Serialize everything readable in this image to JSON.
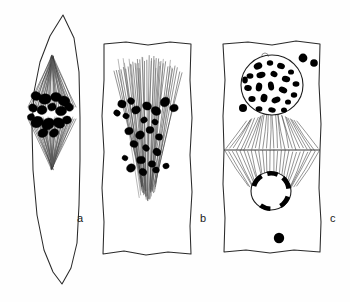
{
  "figure": {
    "caption_visible": false,
    "background_color": "#fefefe",
    "ink_color": "#1a1a1a",
    "chromatin_color": "#000000",
    "panel_count": 3
  },
  "panels": [
    {
      "id": "a",
      "label": "a",
      "label_x": 77,
      "label_y": 222,
      "stage_name": "metaphase",
      "cell_outline": "M 63 15 L 74 38 L 79 72 L 80 118 L 80 160 L 79 205 L 77 243 L 71 268 L 62 284 L 53 272 L 44 250 L 37 215 L 33 170 L 32 128 L 34 92 L 40 62 L 50 36 Z",
      "spindle": {
        "type": "fusiform",
        "pole_top": [
          52,
          57
        ],
        "pole_bottom": [
          52,
          168
        ],
        "equator_y": 113,
        "half_width": 25,
        "fiber_count": 26
      },
      "chromosomes": [
        {
          "cx": 36,
          "cy": 96,
          "rx": 5.0,
          "ry": 4.4
        },
        {
          "cx": 45,
          "cy": 99,
          "rx": 6.2,
          "ry": 5.2
        },
        {
          "cx": 56,
          "cy": 97,
          "rx": 5.4,
          "ry": 4.6
        },
        {
          "cx": 64,
          "cy": 101,
          "rx": 6.0,
          "ry": 5.0
        },
        {
          "cx": 33,
          "cy": 108,
          "rx": 4.4,
          "ry": 4.0
        },
        {
          "cx": 42,
          "cy": 110,
          "rx": 5.0,
          "ry": 4.4
        },
        {
          "cx": 52,
          "cy": 107,
          "rx": 4.2,
          "ry": 3.8
        },
        {
          "cx": 61,
          "cy": 111,
          "rx": 5.6,
          "ry": 4.8
        },
        {
          "cx": 69,
          "cy": 107,
          "rx": 4.6,
          "ry": 4.0
        },
        {
          "cx": 37,
          "cy": 122,
          "rx": 6.4,
          "ry": 5.4
        },
        {
          "cx": 48,
          "cy": 124,
          "rx": 6.6,
          "ry": 5.6
        },
        {
          "cx": 59,
          "cy": 123,
          "rx": 6.0,
          "ry": 5.0
        },
        {
          "cx": 67,
          "cy": 120,
          "rx": 4.4,
          "ry": 4.0
        },
        {
          "cx": 43,
          "cy": 133,
          "rx": 5.2,
          "ry": 4.2
        },
        {
          "cx": 54,
          "cy": 133,
          "rx": 4.8,
          "ry": 4.0
        },
        {
          "cx": 31,
          "cy": 117,
          "rx": 3.6,
          "ry": 3.2
        }
      ]
    },
    {
      "id": "b",
      "label": "b",
      "label_x": 200,
      "label_y": 222,
      "stage_name": "anaphase",
      "cell_outline": "M 104 44 L 126 42 L 148 45 L 170 42 L 191 44 L 190 80 L 192 118 L 190 155 L 192 192 L 190 226 L 191 254 L 168 252 L 146 255 L 124 251 L 103 254 L 104 222 L 102 188 L 104 152 L 102 116 L 104 80 Z",
      "spindle": {
        "type": "broad-cone",
        "apex_top_y": 57,
        "base_y": 200,
        "center_x": 148,
        "top_half_width": 34,
        "fiber_count": 30
      },
      "chromosomes": [
        {
          "cx": 122,
          "cy": 104,
          "rx": 4.2,
          "ry": 3.8
        },
        {
          "cx": 131,
          "cy": 101,
          "rx": 3.6,
          "ry": 3.2
        },
        {
          "cx": 117,
          "cy": 113,
          "rx": 3.4,
          "ry": 3.0
        },
        {
          "cx": 126,
          "cy": 116,
          "rx": 3.2,
          "ry": 2.8
        },
        {
          "cx": 136,
          "cy": 110,
          "rx": 4.4,
          "ry": 3.8
        },
        {
          "cx": 147,
          "cy": 106,
          "rx": 4.6,
          "ry": 4.0
        },
        {
          "cx": 156,
          "cy": 111,
          "rx": 5.0,
          "ry": 4.2
        },
        {
          "cx": 165,
          "cy": 102,
          "rx": 5.2,
          "ry": 4.4
        },
        {
          "cx": 174,
          "cy": 108,
          "rx": 4.2,
          "ry": 3.6
        },
        {
          "cx": 144,
          "cy": 120,
          "rx": 3.4,
          "ry": 3.0
        },
        {
          "cx": 155,
          "cy": 122,
          "rx": 3.2,
          "ry": 2.8
        },
        {
          "cx": 129,
          "cy": 131,
          "rx": 4.2,
          "ry": 3.6
        },
        {
          "cx": 140,
          "cy": 135,
          "rx": 4.6,
          "ry": 4.0
        },
        {
          "cx": 150,
          "cy": 130,
          "rx": 4.0,
          "ry": 3.4
        },
        {
          "cx": 159,
          "cy": 137,
          "rx": 3.6,
          "ry": 3.2
        },
        {
          "cx": 134,
          "cy": 144,
          "rx": 4.0,
          "ry": 3.4
        },
        {
          "cx": 146,
          "cy": 148,
          "rx": 3.6,
          "ry": 3.0
        },
        {
          "cx": 157,
          "cy": 152,
          "rx": 4.2,
          "ry": 3.6
        },
        {
          "cx": 141,
          "cy": 160,
          "rx": 4.4,
          "ry": 3.8
        },
        {
          "cx": 152,
          "cy": 164,
          "rx": 3.8,
          "ry": 3.2
        },
        {
          "cx": 131,
          "cy": 168,
          "rx": 4.6,
          "ry": 4.0
        },
        {
          "cx": 143,
          "cy": 172,
          "rx": 4.0,
          "ry": 3.4
        },
        {
          "cx": 156,
          "cy": 170,
          "rx": 3.4,
          "ry": 3.0
        },
        {
          "cx": 166,
          "cy": 166,
          "rx": 3.2,
          "ry": 2.8
        },
        {
          "cx": 125,
          "cy": 158,
          "rx": 3.0,
          "ry": 2.6
        }
      ]
    },
    {
      "id": "c",
      "label": "c",
      "label_x": 330,
      "label_y": 222,
      "stage_name": "telophase-with-cell-plate",
      "cell_outline": "M 223 44 L 248 42 L 272 45 L 296 41 L 320 44 L 319 84 L 321 124 L 320 150 L 319 188 L 321 222 L 320 252 L 294 250 L 270 253 L 246 250 L 224 252 L 225 218 L 223 184 L 224 150 L 223 116 L 225 80 Z",
      "cell_plate": {
        "x1": 224,
        "y1": 150,
        "x2": 320,
        "y2": 150
      },
      "upper_nucleus": {
        "cx": 272,
        "cy": 85,
        "rx": 31,
        "ry": 30
      },
      "lower_nucleus": {
        "cx": 271,
        "cy": 191,
        "rx": 20,
        "ry": 19
      },
      "upper_fibers": {
        "center_x": 272,
        "top_y": 112,
        "bottom_y": 149,
        "count": 26
      },
      "lower_fibers": {
        "center_x": 272,
        "top_y": 151,
        "bottom_y": 196,
        "count": 26
      },
      "nucleus_top_notch": {
        "cx": 265,
        "cy": 53,
        "r": 3.4
      },
      "upper_chromatin": [
        {
          "cx": 258,
          "cy": 66,
          "rx": 4.4,
          "ry": 3.4,
          "rot": -25
        },
        {
          "cx": 270,
          "cy": 63,
          "rx": 3.2,
          "ry": 2.8,
          "rot": 0
        },
        {
          "cx": 281,
          "cy": 66,
          "rx": 4.0,
          "ry": 3.0,
          "rot": 20
        },
        {
          "cx": 291,
          "cy": 72,
          "rx": 3.0,
          "ry": 2.6,
          "rot": 0
        },
        {
          "cx": 250,
          "cy": 76,
          "rx": 3.4,
          "ry": 2.8,
          "rot": 0
        },
        {
          "cx": 261,
          "cy": 75,
          "rx": 4.6,
          "ry": 3.0,
          "rot": -15
        },
        {
          "cx": 274,
          "cy": 74,
          "rx": 3.6,
          "ry": 3.0,
          "rot": 30
        },
        {
          "cx": 286,
          "cy": 79,
          "rx": 4.2,
          "ry": 3.2,
          "rot": 15
        },
        {
          "cx": 296,
          "cy": 84,
          "rx": 3.4,
          "ry": 2.8,
          "rot": 0
        },
        {
          "cx": 248,
          "cy": 88,
          "rx": 3.8,
          "ry": 3.0,
          "rot": 10
        },
        {
          "cx": 259,
          "cy": 87,
          "rx": 3.2,
          "ry": 4.4,
          "rot": 10
        },
        {
          "cx": 271,
          "cy": 86,
          "rx": 3.0,
          "ry": 4.6,
          "rot": -10
        },
        {
          "cx": 283,
          "cy": 90,
          "rx": 4.4,
          "ry": 3.0,
          "rot": 25
        },
        {
          "cx": 294,
          "cy": 95,
          "rx": 3.2,
          "ry": 2.8,
          "rot": 0
        },
        {
          "cx": 252,
          "cy": 99,
          "rx": 3.6,
          "ry": 3.0,
          "rot": 0
        },
        {
          "cx": 264,
          "cy": 98,
          "rx": 3.4,
          "ry": 4.2,
          "rot": 15
        },
        {
          "cx": 276,
          "cy": 100,
          "rx": 4.6,
          "ry": 3.0,
          "rot": -20
        },
        {
          "cx": 288,
          "cy": 102,
          "rx": 3.0,
          "ry": 2.6,
          "rot": 0
        },
        {
          "cx": 259,
          "cy": 109,
          "rx": 3.4,
          "ry": 2.8,
          "rot": 0
        },
        {
          "cx": 272,
          "cy": 110,
          "rx": 3.8,
          "ry": 2.6,
          "rot": 10
        },
        {
          "cx": 284,
          "cy": 110,
          "rx": 3.0,
          "ry": 2.6,
          "rot": 0
        },
        {
          "cx": 245,
          "cy": 80,
          "rx": 2.8,
          "ry": 3.4,
          "rot": 0
        }
      ],
      "external_chromatin": [
        {
          "cx": 303,
          "cy": 58,
          "r": 4.4
        },
        {
          "cx": 314,
          "cy": 63,
          "r": 3.8
        },
        {
          "cx": 243,
          "cy": 108,
          "r": 4.0
        }
      ],
      "lower_chromatin_arcs": [
        {
          "cx": 271,
          "cy": 191,
          "r": 20,
          "a0": 196,
          "a1": 238
        },
        {
          "cx": 271,
          "cy": 191,
          "r": 20,
          "a0": 258,
          "a1": 292
        },
        {
          "cx": 271,
          "cy": 191,
          "r": 20,
          "a0": 312,
          "a1": 352
        },
        {
          "cx": 271,
          "cy": 191,
          "r": 20,
          "a0": 18,
          "a1": 58
        },
        {
          "cx": 271,
          "cy": 191,
          "r": 20,
          "a0": 92,
          "a1": 126
        }
      ],
      "free_granule": {
        "cx": 279,
        "cy": 238,
        "r": 5.2
      }
    }
  ]
}
